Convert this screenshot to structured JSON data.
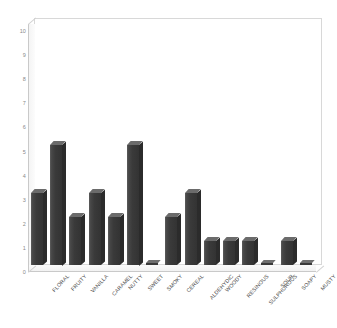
{
  "chart_data": {
    "type": "bar",
    "title": "",
    "subtitle": "",
    "xlabel": "",
    "ylabel": "",
    "ylim": [
      0,
      10
    ],
    "yticks": [
      0,
      1,
      2,
      3,
      4,
      5,
      6,
      7,
      8,
      9,
      10
    ],
    "grid": false,
    "legend": null,
    "legend_position": "none",
    "style": "3d-column",
    "categories": [
      "FLORAL",
      "FRUITY",
      "VANILLA",
      "CARAMEL",
      "NUTTY",
      "SWEET",
      "SMOKY",
      "CEREAL",
      "ALDEHYDIC",
      "WOODY",
      "RESINOUS",
      "SULPHUROUS",
      "SOUR",
      "SOAPY",
      "MUSTY"
    ],
    "values": [
      3,
      5,
      2,
      3,
      2,
      5,
      0,
      2,
      3,
      1,
      1,
      1,
      0,
      1,
      0
    ],
    "colors": {
      "bar_front": "#3a3a3a",
      "bar_top": "#6b6b6b",
      "bar_side": "#2b2b2b",
      "plot_border": "#d8d8d8",
      "axis_line": "#c9c9c9",
      "tick_text": "#8a8a8a",
      "category_text": "#4a4a4a",
      "background": "#ffffff"
    }
  }
}
